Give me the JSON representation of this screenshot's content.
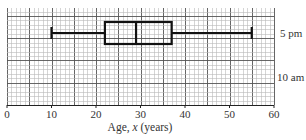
{
  "chart_data": {
    "type": "boxplot",
    "title": "",
    "xlabel": "Age, x (years)",
    "xlabel_parts": {
      "prefix": "Age, ",
      "var": "x",
      "suffix": " (years)"
    },
    "ylabel": "",
    "xlim": [
      0,
      60
    ],
    "x_ticks": [
      0,
      10,
      20,
      30,
      40,
      50,
      60
    ],
    "x_tick_labels": [
      "0",
      "10",
      "20",
      "30",
      "40",
      "50",
      "60"
    ],
    "grid": {
      "on": true,
      "major_step": 5,
      "minor_step": 1
    },
    "rows": [
      {
        "label": "5 pm",
        "has_plot": true
      },
      {
        "label": "10 am",
        "has_plot": false
      }
    ],
    "series": [
      {
        "name": "5 pm",
        "min": 10,
        "q1": 22,
        "median": 29,
        "q3": 37,
        "max": 55
      }
    ]
  },
  "colors": {
    "grid_minor": "#b8b8b8",
    "grid_major": "#555555",
    "box": "#111111",
    "text": "#333333"
  }
}
